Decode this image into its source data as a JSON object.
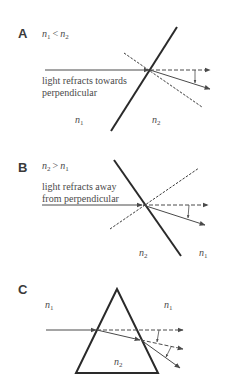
{
  "figure": {
    "colors": {
      "interface": "#2a2a2a",
      "ray": "#4a4a4a",
      "text": "#4a4a4a",
      "label": "#3a3a3a"
    }
  },
  "panels": [
    {
      "label": "A",
      "condition": {
        "left": "n",
        "left_sub": "1",
        "op": "<",
        "right": "n",
        "right_sub": "2"
      },
      "caption": [
        "light refracts towards",
        "perpendicular"
      ],
      "media": [
        {
          "n": "n",
          "sub": "1",
          "side": "left"
        },
        {
          "n": "n",
          "sub": "2",
          "side": "right"
        }
      ]
    },
    {
      "label": "B",
      "condition": {
        "left": "n",
        "left_sub": "2",
        "op": ">",
        "right": "n",
        "right_sub": "1"
      },
      "caption": [
        "light refracts away",
        "from perpendicular"
      ],
      "media": [
        {
          "n": "n",
          "sub": "2",
          "side": "left"
        },
        {
          "n": "n",
          "sub": "1",
          "side": "right"
        }
      ]
    },
    {
      "label": "C",
      "media": [
        {
          "n": "n",
          "sub": "1",
          "side": "left"
        },
        {
          "n": "n",
          "sub": "1",
          "side": "right"
        },
        {
          "n": "n",
          "sub": "2",
          "side": "prism"
        }
      ]
    }
  ]
}
